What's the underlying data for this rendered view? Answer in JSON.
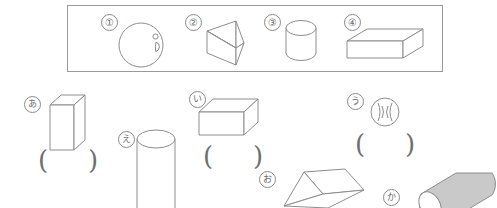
{
  "worksheet": {
    "background_color": "#ffffff",
    "stroke_color": "#8d8d8d",
    "frame_color": "#9a9a9a",
    "shaded_fill": "#c9c9c9"
  },
  "answer_bank": {
    "name": "boxed-solid-choices",
    "items": [
      {
        "label": "①",
        "shape": "sphere",
        "shape_name_ja": "球"
      },
      {
        "label": "②",
        "shape": "triangular-prism",
        "shape_name_ja": "三角柱"
      },
      {
        "label": "③",
        "shape": "cylinder",
        "shape_name_ja": "円柱"
      },
      {
        "label": "④",
        "shape": "rectangular-prism",
        "shape_name_ja": "直方体"
      }
    ]
  },
  "questions": {
    "name": "lettered-solids",
    "open_paren": "(",
    "close_paren": ")",
    "items": [
      {
        "label": "あ",
        "shape": "tall-rectangular-prism",
        "answer": "",
        "has_answer_box": true
      },
      {
        "label": "い",
        "shape": "rectangular-prism",
        "answer": "",
        "has_answer_box": true
      },
      {
        "label": "う",
        "shape": "ball-sphere",
        "answer": "",
        "has_answer_box": true
      },
      {
        "label": "え",
        "shape": "tall-cylinder",
        "answer": "",
        "has_answer_box": false
      },
      {
        "label": "お",
        "shape": "triangular-prism",
        "answer": "",
        "has_answer_box": false
      },
      {
        "label": "か",
        "shape": "shaded-cylinder",
        "answer": "",
        "has_answer_box": false
      }
    ]
  }
}
